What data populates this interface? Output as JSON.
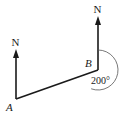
{
  "diagram": {
    "type": "bearing-diagram",
    "points": [
      {
        "id": "A",
        "label": "A"
      },
      {
        "id": "B",
        "label": "B"
      }
    ],
    "north_markers": [
      {
        "at": "A",
        "label": "N"
      },
      {
        "at": "B",
        "label": "N"
      }
    ],
    "segment": {
      "from": "A",
      "to": "B"
    },
    "angle": {
      "at": "B",
      "value_deg": 200,
      "label": "200°",
      "direction": "clockwise-from-north"
    },
    "colors": {
      "line": "#1a1a1a",
      "arc": "#555555",
      "text": "#1a1a1a"
    }
  }
}
